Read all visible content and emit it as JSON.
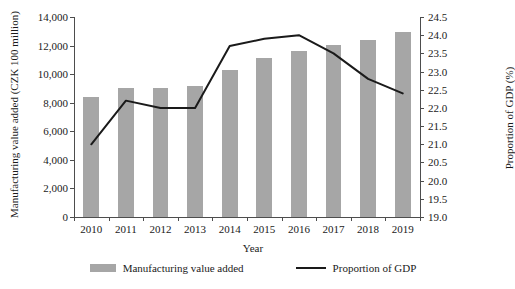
{
  "chart_data": {
    "type": "bar",
    "title": "",
    "xlabel": "Year",
    "ylabel": "Manufacturing value added (CZK 100 million)",
    "y2label": "Proportion of GDP (%)",
    "categories": [
      "2010",
      "2011",
      "2012",
      "2013",
      "2014",
      "2015",
      "2016",
      "2017",
      "2018",
      "2019"
    ],
    "ylim": [
      0,
      14000
    ],
    "y2lim": [
      19.0,
      24.5
    ],
    "yticks": [
      "0",
      "2,000",
      "4,000",
      "6,000",
      "8,000",
      "10,000",
      "12,000",
      "14,000"
    ],
    "ytick_values": [
      0,
      2000,
      4000,
      6000,
      8000,
      10000,
      12000,
      14000
    ],
    "y2ticks": [
      "19.0",
      "19.5",
      "20.0",
      "20.5",
      "21.0",
      "21.5",
      "22.0",
      "22.5",
      "23.0",
      "23.5",
      "24.0",
      "24.5"
    ],
    "y2tick_values": [
      19.0,
      19.5,
      20.0,
      20.5,
      21.0,
      21.5,
      22.0,
      22.5,
      23.0,
      23.5,
      24.0,
      24.5
    ],
    "grid": false,
    "legend_position": "bottom",
    "series": [
      {
        "name": "Manufacturing value added",
        "type": "bar",
        "axis": "left",
        "color": "#a6a6a6",
        "values": [
          8400,
          9000,
          9050,
          9200,
          10300,
          11150,
          11650,
          12050,
          12400,
          12950
        ]
      },
      {
        "name": "Proportion of GDP",
        "type": "line",
        "axis": "right",
        "color": "#1a1a1a",
        "values": [
          21.0,
          22.2,
          22.0,
          22.0,
          23.7,
          23.9,
          24.0,
          23.5,
          22.8,
          22.4
        ]
      }
    ]
  },
  "legend": {
    "items": [
      {
        "label": "Manufacturing value added",
        "marker": "bar-swatch",
        "color": "#a6a6a6"
      },
      {
        "label": "Proportion of GDP",
        "marker": "line-swatch",
        "color": "#1a1a1a"
      }
    ]
  }
}
